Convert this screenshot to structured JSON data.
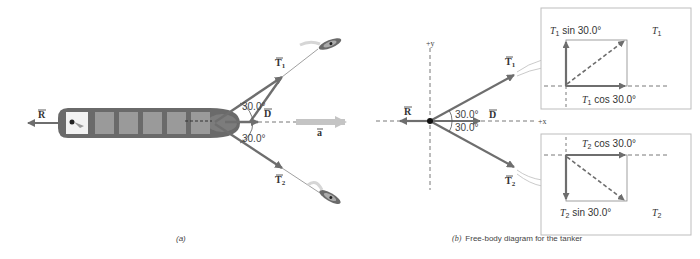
{
  "figure_a": {
    "caption": "(a)",
    "vectors": {
      "R": "R",
      "D": "D",
      "a": "a",
      "T1": "T",
      "T1_sub": "1",
      "T2": "T",
      "T2_sub": "2"
    },
    "angle_top": "30.0°",
    "angle_bottom": "30.0°"
  },
  "figure_b": {
    "caption_prefix": "(b)",
    "caption_text": "Free-body diagram for the tanker",
    "axis_x": "+x",
    "axis_y": "+y",
    "vectors": {
      "R": "R",
      "D": "D",
      "T1": "T",
      "T1_sub": "1",
      "T2": "T",
      "T2_sub": "2"
    },
    "angle_top": "30.0°",
    "angle_bottom": "30.0°",
    "inset_top": {
      "vertical_label_T": "T",
      "vertical_label_sub": "1",
      "vertical_label_rest": " sin 30.0°",
      "horizontal_label_T": "T",
      "horizontal_label_sub": "1",
      "horizontal_label_rest": " cos 30.0°",
      "resultant_T": "T",
      "resultant_sub": "1"
    },
    "inset_bottom": {
      "horizontal_label_T": "T",
      "horizontal_label_sub": "2",
      "horizontal_label_rest": " cos 30.0°",
      "vertical_label_T": "T",
      "vertical_label_sub": "2",
      "vertical_label_rest": " sin 30.0°",
      "resultant_T": "T",
      "resultant_sub": "2"
    }
  },
  "colors": {
    "vector": "#6e6e6e",
    "ship_hull": "#6a6a6a",
    "ship_cargo": "#9a9a9a",
    "acceleration": "#bdbdbd",
    "dashed": "#555555",
    "inset_border": "#bdbdbd"
  }
}
